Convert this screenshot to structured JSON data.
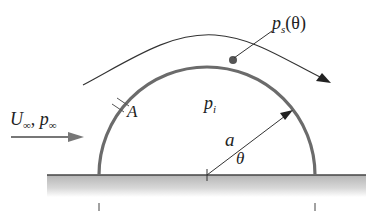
{
  "diagram": {
    "colors": {
      "shell": "#6b6b6b",
      "streamline": "#333333",
      "ground_line": "#444444",
      "ground_fill": "#bdbdbd",
      "text": "#222222"
    },
    "labels": {
      "freestream_U": "U",
      "freestream_U_sub": "∞",
      "freestream_sep": ", ",
      "freestream_p": "p",
      "freestream_p_sub": "∞",
      "surface_pressure": "p",
      "surface_pressure_sub": "s",
      "surface_pressure_arg": "(θ)",
      "internal_pressure": "p",
      "internal_pressure_sub": "i",
      "point_A": "A",
      "radius": "a",
      "angle": "θ"
    },
    "geometry": {
      "center_x": 207,
      "ground_y": 175,
      "radius": 108,
      "ground_x_start": 47,
      "ground_x_end": 366
    }
  }
}
